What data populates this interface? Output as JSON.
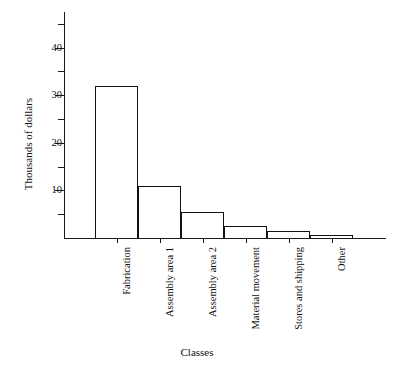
{
  "chart_data": {
    "type": "bar",
    "title": "",
    "xlabel": "Classes",
    "ylabel": "Thousands of dollars",
    "categories": [
      "Fabrication",
      "Assembly area 1",
      "Assembly area 2",
      "Material movement",
      "Stores and shipping",
      "Other"
    ],
    "values": [
      32,
      11,
      5.5,
      2.5,
      1.4,
      0.6
    ],
    "ylim": [
      0,
      47.5
    ],
    "yticks_major": [
      10,
      20,
      30,
      40
    ],
    "yticks_minor": [
      5,
      15,
      25,
      35,
      45
    ],
    "ytick_labels": [
      "10",
      "20",
      "30",
      "40"
    ],
    "grid": false,
    "legend": false,
    "bar_style": "adjacent-outline",
    "colors": {
      "axis": "#1a1a1a",
      "bar_edge": "#111111",
      "bar_fill": "#ffffff",
      "background": "#ffffff",
      "text": "#111111"
    }
  }
}
